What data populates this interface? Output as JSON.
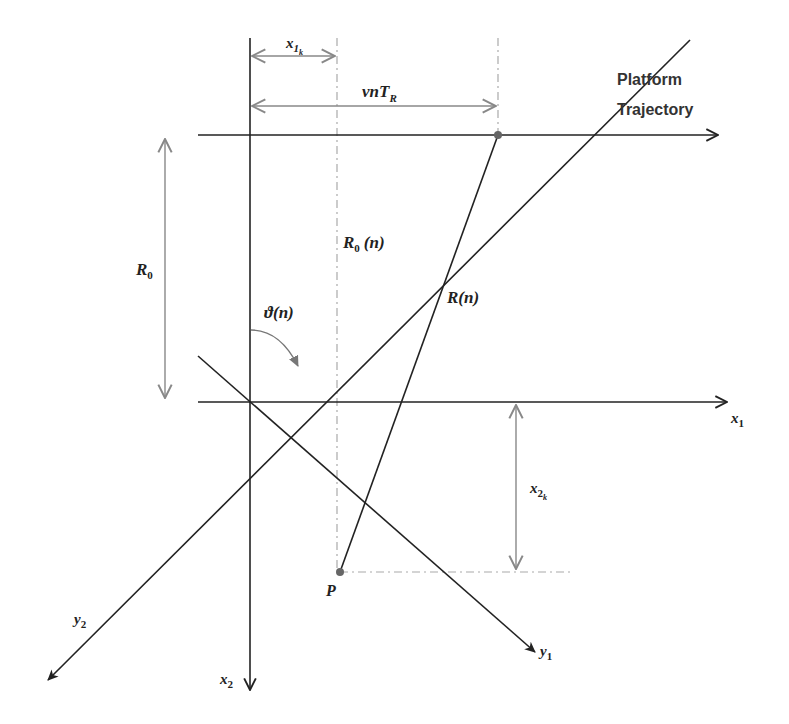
{
  "diagram": {
    "title_label": {
      "line1": "Platform",
      "line2": "Trajectory"
    },
    "labels": {
      "x1k": {
        "base": "x",
        "sub": "1",
        "subsub": "k"
      },
      "vnTR": {
        "base": "vnT",
        "sub": "R"
      },
      "R0": {
        "base": "R",
        "sub": "0"
      },
      "R0n": {
        "base": "R",
        "sub": "0",
        "arg": "(n)"
      },
      "Rn": {
        "base": "R",
        "arg": "(n)"
      },
      "theta_n": {
        "base": "ϑ",
        "arg": "(n)"
      },
      "x1": {
        "base": "x",
        "sub": "1"
      },
      "x2": {
        "base": "x",
        "sub": "2"
      },
      "x2k": {
        "base": "x",
        "sub": "2",
        "subsub": "k"
      },
      "y1": {
        "base": "y",
        "sub": "1"
      },
      "y2": {
        "base": "y",
        "sub": "2"
      },
      "P": {
        "base": "P"
      }
    },
    "colors": {
      "line": "#222222",
      "dimension": "#888888",
      "dash": "#aaaaaa",
      "point": "#666666",
      "background": "#ffffff"
    }
  }
}
